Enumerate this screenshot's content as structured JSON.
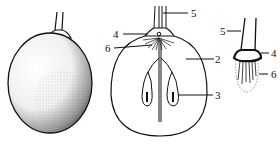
{
  "figure": {
    "panels": [
      {
        "id": "external-view",
        "description": "Whole fruit, external view with stipple shading"
      },
      {
        "id": "longitudinal-section",
        "description": "Longitudinal section of fruit"
      },
      {
        "id": "stalk-detail",
        "description": "Detail of stalk and base"
      }
    ],
    "labels": {
      "section_stalk": "5",
      "section_ring": "4",
      "section_fibers": "6",
      "section_body": "2",
      "section_seed": "3",
      "detail_stalk": "5",
      "detail_ring": "4",
      "detail_fibers": "6"
    },
    "colors": {
      "ink": "#111111",
      "background": "#ffffff"
    }
  }
}
